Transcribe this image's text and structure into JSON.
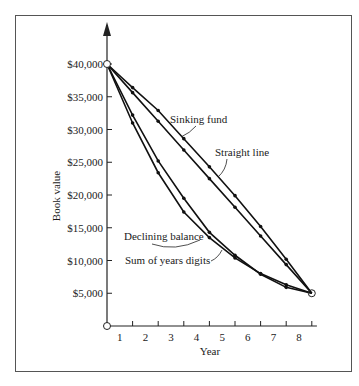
{
  "chart_data": {
    "type": "line",
    "title": "",
    "xlabel": "Year",
    "ylabel": "Book value",
    "x": [
      0,
      1,
      2,
      3,
      4,
      5,
      6,
      7,
      8
    ],
    "x_tick_labels": [
      "1",
      "2",
      "3",
      "4",
      "5",
      "6",
      "7",
      "8"
    ],
    "y_tick_labels": [
      "$5,000",
      "$10,000",
      "$15,000",
      "$20,000",
      "$25,000",
      "$30,000",
      "$35,000",
      "$40,000"
    ],
    "y_ticks": [
      5000,
      10000,
      15000,
      20000,
      25000,
      30000,
      35000,
      40000
    ],
    "ylim": [
      0,
      43000
    ],
    "xlim": [
      0,
      8.5
    ],
    "grid": false,
    "legend": "inline labels with leader lines",
    "series": [
      {
        "name": "Sinking fund",
        "values": [
          40000,
          36400,
          32900,
          28600,
          24300,
          19900,
          15200,
          10200,
          5000
        ]
      },
      {
        "name": "Straight line",
        "values": [
          40000,
          35625,
          31250,
          26875,
          22500,
          18125,
          13750,
          9375,
          5000
        ]
      },
      {
        "name": "Declining balance",
        "values": [
          40000,
          32200,
          25200,
          19500,
          14300,
          10800,
          7900,
          5900,
          5000
        ]
      },
      {
        "name": "Sum of years digits",
        "values": [
          40000,
          31000,
          23400,
          17400,
          13500,
          10400,
          8000,
          6300,
          5000
        ]
      }
    ],
    "annotations": [
      "Sinking fund",
      "Straight line",
      "Declining balance",
      "Sum of years digits"
    ]
  }
}
